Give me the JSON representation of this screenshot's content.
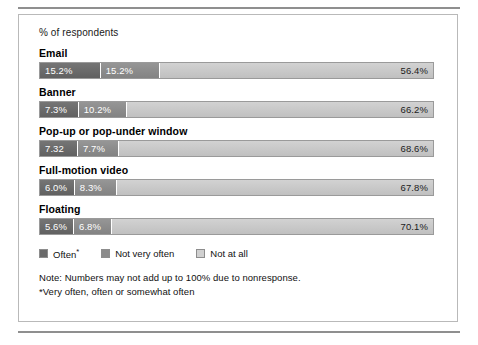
{
  "chart_data": {
    "type": "bar",
    "title": "",
    "subtitle": "",
    "xlabel": "% of respondents",
    "ylabel": "",
    "xlim": [
      0,
      100
    ],
    "grid": false,
    "orientation": "horizontal",
    "stacked": true,
    "legend_position": "bottom-left",
    "categories": [
      "Email",
      "Banner",
      "Pop-up or pop-under window",
      "Full-motion video",
      "Floating"
    ],
    "series": [
      {
        "name": "Often*",
        "color": "#6a6a6a",
        "values": [
          15.2,
          7.3,
          7.3,
          6.0,
          5.6
        ],
        "labels": [
          "15.2%",
          "7.3%",
          "7.32",
          "6.0%",
          "5.6%"
        ]
      },
      {
        "name": "Not very often",
        "color": "#8b8b8b",
        "values": [
          15.2,
          10.2,
          7.7,
          8.3,
          6.8
        ],
        "labels": [
          "15.2%",
          "10.2%",
          "7.7%",
          "8.3%",
          "6.8%"
        ]
      },
      {
        "name": "Not at all",
        "color": "#d0d0d0",
        "values": [
          56.4,
          66.2,
          68.6,
          67.8,
          70.1
        ],
        "labels": [
          "56.4%",
          "66.2%",
          "68.6%",
          "67.8%",
          "70.1%"
        ]
      }
    ],
    "notes": [
      "Note: Numbers may not add up to 100% due to nonresponse.",
      "*Very often, often or somewhat often"
    ]
  },
  "panel": {
    "axis_label": "% of respondents"
  }
}
